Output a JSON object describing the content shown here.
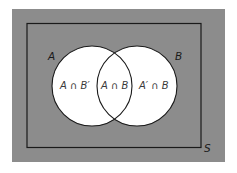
{
  "diagram": {
    "type": "venn",
    "universe_label": "S",
    "set_a_label": "A",
    "set_b_label": "B",
    "regions": {
      "a_only": "A ∩ B′",
      "a_and_b": "A ∩ B",
      "b_only": "A′ ∩ B"
    },
    "colors": {
      "background": "#8c8c8c",
      "circle_fill": "#ffffff",
      "stroke": "#1a1a1a"
    }
  }
}
